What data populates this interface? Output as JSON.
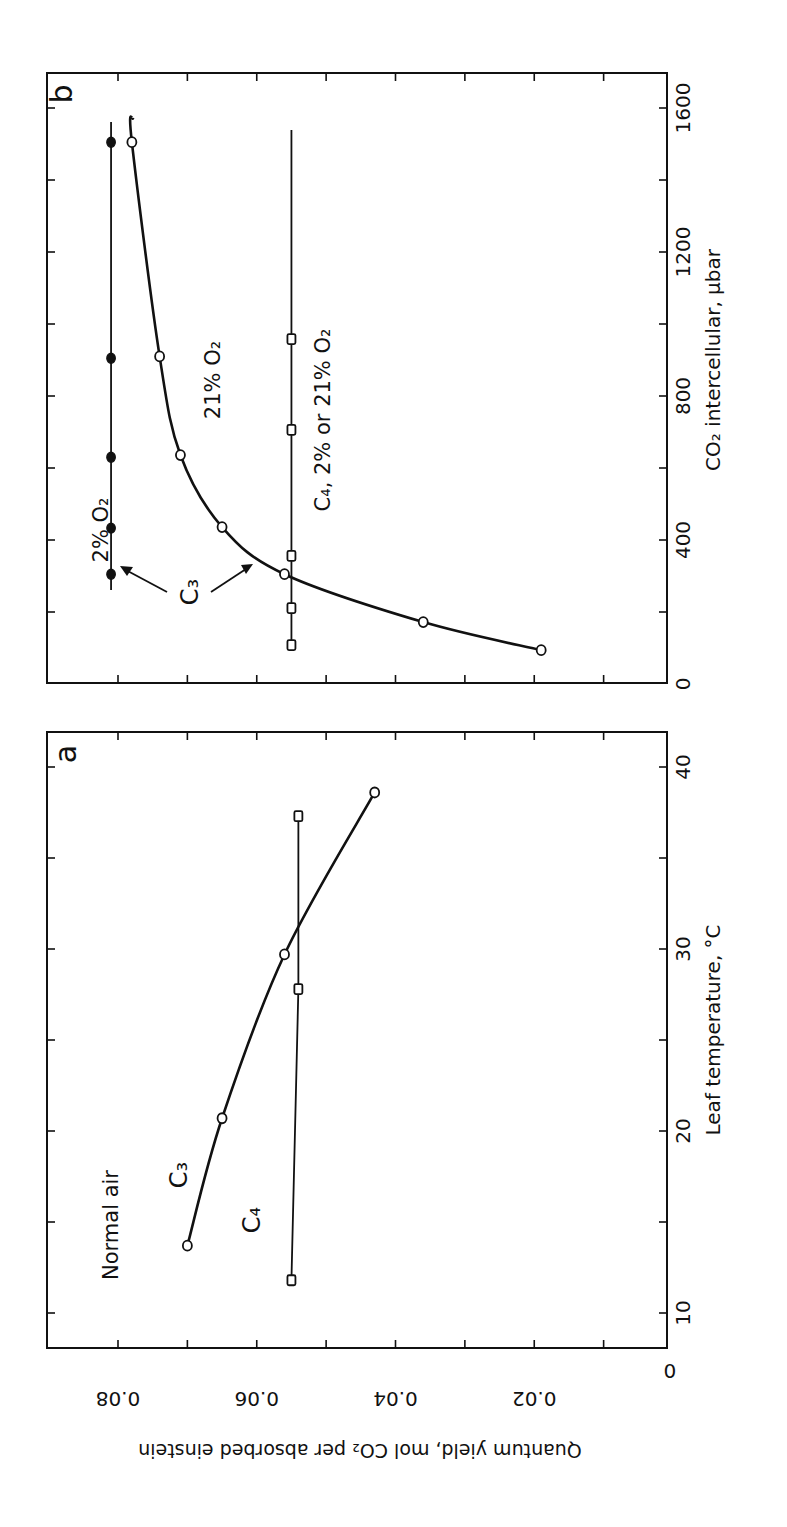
{
  "figure": {
    "panel_a_label": "a",
    "panel_b_label": "b",
    "y_label": "Quantum yield, mol CO₂ per absorbed einstein",
    "panel_a_xlabel": "Leaf temperature, °C",
    "panel_b_xlabel": "CO₂ intercellular, μbar",
    "annotations": {
      "normal_air": "Normal air",
      "a_c3": "C₃",
      "a_c4": "C₄",
      "b_2pct": "2% O₂",
      "b_21pct": "21% O₂",
      "b_c3": "C₃",
      "b_c4": "C₄, 2% or 21% O₂"
    },
    "colors": {
      "ink": "#111111",
      "background": "#ffffff"
    }
  },
  "chart_data": [
    {
      "panel": "a",
      "type": "line",
      "title": "Normal air",
      "xlabel": "Leaf temperature, °C",
      "ylabel": "Quantum yield, mol CO2 per absorbed einstein",
      "xlim": [
        8,
        42
      ],
      "ylim": [
        0,
        0.09
      ],
      "xticks": [
        10,
        20,
        30,
        40
      ],
      "yticks": [
        0,
        0.02,
        0.04,
        0.06,
        0.08
      ],
      "grid": false,
      "orientation_note": "figure is rotated 90 degrees on the page",
      "series": [
        {
          "name": "C3",
          "marker": "open-circle",
          "x": [
            13.7,
            20.7,
            29.7,
            38.6
          ],
          "y": [
            0.07,
            0.065,
            0.056,
            0.043
          ]
        },
        {
          "name": "C4",
          "marker": "open-square",
          "x": [
            11.8,
            27.8,
            37.3
          ],
          "y": [
            0.055,
            0.054,
            0.054
          ]
        }
      ]
    },
    {
      "panel": "b",
      "type": "line",
      "title": "",
      "xlabel": "CO2 intercellular, μbar",
      "ylabel": "Quantum yield, mol CO2 per absorbed einstein",
      "xlim": [
        0,
        1650
      ],
      "ylim": [
        0,
        0.09
      ],
      "xticks": [
        0,
        400,
        800,
        1200,
        1600
      ],
      "yticks": [
        0,
        0.02,
        0.04,
        0.06,
        0.08
      ],
      "grid": false,
      "series": [
        {
          "name": "C3, 2% O2",
          "marker": "filled-circle",
          "x": [
            305,
            433,
            630,
            905,
            1505
          ],
          "y": [
            0.081,
            0.081,
            0.081,
            0.081,
            0.081
          ]
        },
        {
          "name": "C3, 21% O2",
          "marker": "open-circle",
          "x": [
            94,
            172,
            305,
            436,
            636,
            910,
            1505
          ],
          "y": [
            0.019,
            0.036,
            0.056,
            0.065,
            0.071,
            0.074,
            0.078
          ]
        },
        {
          "name": "C4, 2% or 21% O2",
          "marker": "open-square",
          "x": [
            108,
            211,
            356,
            706,
            958
          ],
          "y": [
            0.055,
            0.055,
            0.055,
            0.055,
            0.055
          ]
        }
      ]
    }
  ]
}
